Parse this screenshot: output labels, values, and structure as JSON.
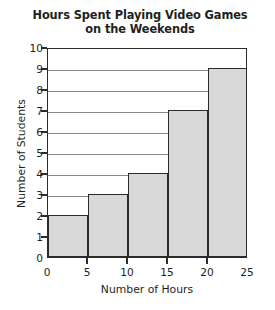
{
  "chart_data": {
    "type": "bar",
    "title": "Hours Spent Playing Video Games on the Weekends",
    "title_line1": "Hours Spent Playing Video Games",
    "title_line2": "on the Weekends",
    "xlabel": "Number of Hours",
    "ylabel": "Number of Students",
    "categories": [
      "0-5",
      "5-10",
      "10-15",
      "15-20",
      "20-25"
    ],
    "bin_edges": [
      0,
      5,
      10,
      15,
      20,
      25
    ],
    "values": [
      2,
      3,
      4,
      7,
      9
    ],
    "xlim": [
      0,
      25
    ],
    "ylim": [
      0,
      10
    ],
    "x_ticks": [
      0,
      5,
      10,
      15,
      20,
      25
    ],
    "y_ticks": [
      0,
      1,
      2,
      3,
      4,
      5,
      6,
      7,
      8,
      9,
      10
    ],
    "grid": true,
    "grid_axis": "y",
    "legend": false,
    "bar_fill_color": "#d9d9d9",
    "bar_edge_color": "#2b2b2b",
    "grid_color": "#8a8a8a",
    "text_color": "#231f20",
    "background_color": "#ffffff"
  }
}
